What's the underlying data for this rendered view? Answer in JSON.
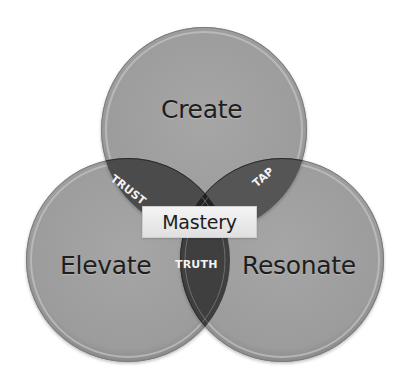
{
  "diagram": {
    "type": "venn-3",
    "colors": {
      "background": "#ffffff",
      "circle_fill": "#a0a0a0",
      "circle_rim": "#c8c8c8",
      "pair_overlap_fill": "#4b4b4b",
      "triple_overlap_fill": "#222222",
      "label_dark": "#1e1e1e",
      "label_light": "#f2f2f2",
      "center_box_fill": "#ececec"
    },
    "circles": [
      {
        "id": "create",
        "label": "Create",
        "cx": 204,
        "cy": 130,
        "r": 103
      },
      {
        "id": "elevate",
        "label": "Elevate",
        "cx": 128,
        "cy": 260,
        "r": 102
      },
      {
        "id": "resonate",
        "label": "Resonate",
        "cx": 282,
        "cy": 260,
        "r": 102
      }
    ],
    "overlaps": {
      "create_elevate": "TRUST",
      "create_resonate": "TAP",
      "elevate_resonate": "TRUTH"
    },
    "center": {
      "label": "Mastery"
    }
  }
}
